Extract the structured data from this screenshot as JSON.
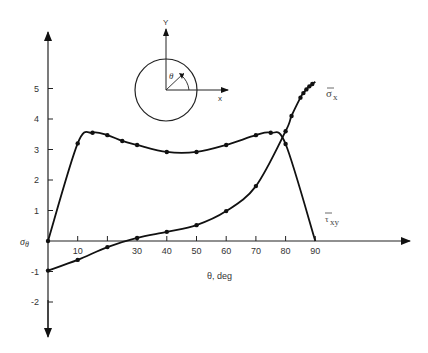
{
  "chart_data": {
    "type": "line",
    "title": "",
    "xlabel": "θ, deg",
    "ylabel": "σθ",
    "xlim": [
      0,
      90
    ],
    "ylim": [
      -2,
      5
    ],
    "x_ticks": [
      10,
      20,
      30,
      40,
      50,
      60,
      70,
      80,
      90
    ],
    "x_tick_labels": [
      "10",
      "",
      "30",
      "40",
      "50",
      "60",
      "70",
      "80",
      "90"
    ],
    "y_ticks": [
      5,
      4,
      3,
      2,
      1,
      -1,
      -2
    ],
    "y_tick_labels": [
      "5",
      "4",
      "3",
      "2",
      "1",
      "-1",
      "-2"
    ],
    "grid": false,
    "legend": "inline labels at curve ends",
    "series": [
      {
        "name": "σ̄x",
        "label_main": "σ",
        "label_sub": "x",
        "x": [
          0,
          10,
          15,
          20,
          25,
          30,
          40,
          50,
          60,
          70,
          75,
          80,
          90
        ],
        "values": [
          0,
          3.2,
          3.55,
          3.47,
          3.28,
          3.15,
          2.92,
          2.92,
          3.15,
          3.47,
          3.55,
          3.18,
          0
        ],
        "markers_x": [
          0,
          10,
          15,
          20,
          25,
          30,
          40,
          50,
          60,
          70,
          75,
          80
        ]
      },
      {
        "name": "τ̄xy",
        "label_main": "τ",
        "label_sub": "xy",
        "x": [
          0,
          10,
          20,
          30,
          40,
          50,
          60,
          70,
          80,
          82,
          85,
          86,
          87,
          88,
          89,
          90
        ],
        "values": [
          -0.97,
          -0.62,
          -0.2,
          0.1,
          0.3,
          0.52,
          0.98,
          1.8,
          3.6,
          4.1,
          4.7,
          4.85,
          4.97,
          5.07,
          5.15,
          5.22
        ],
        "markers_x": [
          0,
          10,
          20,
          30,
          40,
          50,
          60,
          70,
          80,
          82,
          85,
          86,
          87,
          88,
          89
        ]
      }
    ],
    "inset": {
      "description": "circle with x and y axes, angle theta measured from y-axis",
      "y_axis_label": "Y",
      "x_axis_label": "x",
      "angle_label": "θ"
    }
  }
}
